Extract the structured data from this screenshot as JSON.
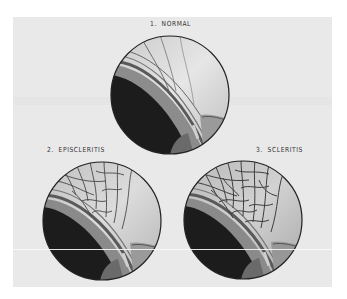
{
  "figure": {
    "background_color": "#e9e9e9",
    "panels": [
      {
        "number": "1.",
        "title": "NORMAL",
        "condition": "normal",
        "vessel_density": "low"
      },
      {
        "number": "2.",
        "title": "EPISCLERITIS",
        "condition": "episcleritis",
        "vessel_density": "high"
      },
      {
        "number": "3.",
        "title": "SCLERITIS",
        "condition": "scleritis",
        "vessel_density": "very-high"
      }
    ]
  },
  "colors": {
    "sclera": "#d8d8d8",
    "cornea_dark": "#1c1c1c",
    "limbus": "#8a8a8a",
    "vessel": "#4a4a4a",
    "outline": "#222222"
  }
}
